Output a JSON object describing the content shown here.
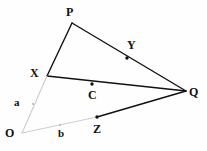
{
  "figure": {
    "background_color": "#fefefe",
    "stroke_color_solid": "#111111",
    "stroke_color_faint": "#cfcfcf",
    "point_color": "#111111",
    "point_color_faint": "#b8b8b8",
    "width": 207,
    "height": 151
  },
  "labels": {
    "p": "P",
    "x": "X",
    "q": "Q",
    "o": "O",
    "y": "Y",
    "c": "C",
    "z": "Z",
    "a": "a",
    "b": "b"
  },
  "chart_data": {
    "type": "scatter",
    "xlabel": "",
    "ylabel": "",
    "xlim": [
      0,
      207
    ],
    "ylim": [
      0,
      151
    ],
    "grid": false,
    "legend": null,
    "coordinate_system": "pixel, origin top-left",
    "points": [
      {
        "name": "P",
        "x": 72,
        "y": 23,
        "marker": "vertex",
        "dot": false,
        "label": "P",
        "label_x": 66,
        "label_y": 6
      },
      {
        "name": "X",
        "x": 47,
        "y": 76,
        "marker": "vertex",
        "dot": false,
        "label": "X",
        "label_x": 30,
        "label_y": 67
      },
      {
        "name": "Q",
        "x": 186,
        "y": 91,
        "marker": "vertex",
        "dot": false,
        "label": "Q",
        "label_x": 189,
        "label_y": 86
      },
      {
        "name": "O",
        "x": 22,
        "y": 133,
        "marker": "vertex",
        "dot": false,
        "label": "O",
        "label_x": 5,
        "label_y": 127
      },
      {
        "name": "Y",
        "x": 127,
        "y": 58,
        "marker": "point",
        "dot": true,
        "label": "Y",
        "label_x": 127,
        "label_y": 39
      },
      {
        "name": "C",
        "x": 92,
        "y": 84,
        "marker": "point",
        "dot": true,
        "label": "C",
        "label_x": 88,
        "label_y": 89
      },
      {
        "name": "Z",
        "x": 97,
        "y": 117,
        "marker": "point",
        "dot": true,
        "label": "Z",
        "label_x": 93,
        "label_y": 123
      },
      {
        "name": "a",
        "x": 33,
        "y": 104,
        "marker": "point-faint",
        "dot": true,
        "label": "a",
        "label_x": 14,
        "label_y": 97
      },
      {
        "name": "b",
        "x": 60,
        "y": 125,
        "marker": "point-faint",
        "dot": true,
        "label": "b",
        "label_x": 58,
        "label_y": 128
      }
    ],
    "segments": [
      {
        "name": "X-P",
        "from": "X",
        "to": "P",
        "x1": 47,
        "y1": 76,
        "x2": 72,
        "y2": 23,
        "style": "solid",
        "color": "#111111",
        "width": 1.4
      },
      {
        "name": "P-Q",
        "from": "P",
        "to": "Q",
        "x1": 72,
        "y1": 23,
        "x2": 186,
        "y2": 91,
        "style": "solid",
        "color": "#111111",
        "width": 1.4
      },
      {
        "name": "X-Q",
        "from": "X",
        "to": "Q",
        "x1": 47,
        "y1": 76,
        "x2": 186,
        "y2": 91,
        "style": "solid",
        "color": "#111111",
        "width": 1.4
      },
      {
        "name": "Z-Q",
        "from": "Z",
        "to": "Q",
        "x1": 97,
        "y1": 117,
        "x2": 186,
        "y2": 91,
        "style": "solid",
        "color": "#111111",
        "width": 1.4
      },
      {
        "name": "O-X",
        "from": "O",
        "to": "X",
        "x1": 22,
        "y1": 133,
        "x2": 47,
        "y2": 76,
        "style": "solid",
        "color": "#cfcfcf",
        "width": 1.2
      },
      {
        "name": "O-Z",
        "from": "O",
        "to": "Z",
        "x1": 22,
        "y1": 133,
        "x2": 97,
        "y2": 117,
        "style": "solid",
        "color": "#cfcfcf",
        "width": 1.2
      }
    ]
  }
}
